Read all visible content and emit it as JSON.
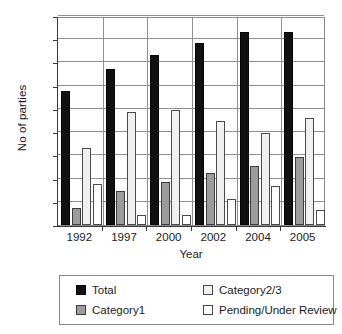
{
  "chart_data": {
    "type": "bar",
    "title": "",
    "xlabel": "Year",
    "ylabel": "No of parties",
    "categories": [
      "1992",
      "1997",
      "2000",
      "2002",
      "2004",
      "2005"
    ],
    "ylim": [
      0,
      180
    ],
    "yticks": [
      0,
      20,
      40,
      60,
      80,
      100,
      120,
      140,
      160,
      180
    ],
    "ytick_labels": [
      "0",
      "20",
      "40",
      "60",
      "80",
      "100",
      "120",
      "140",
      "160",
      "180"
    ],
    "grid": true,
    "legend_position": "bottom",
    "series": [
      {
        "name": "Total",
        "color": "#111111",
        "values": [
          115,
          134,
          146,
          157,
          166,
          166
        ]
      },
      {
        "name": "Category1",
        "color": "#9c9c9c",
        "values": [
          15,
          29,
          37,
          45,
          51,
          59
        ]
      },
      {
        "name": "Category2/3",
        "color": "#f0f0f0",
        "values": [
          66,
          97,
          99,
          90,
          79,
          92
        ]
      },
      {
        "name": "Pending/Under Review",
        "color": "#ffffff",
        "values": [
          35,
          9,
          9,
          22,
          34,
          13
        ]
      }
    ]
  },
  "legend": {
    "items": [
      {
        "label": "Total",
        "swatch": "sw-total"
      },
      {
        "label": "Category2/3",
        "swatch": "sw-cat23"
      },
      {
        "label": "Category1",
        "swatch": "sw-cat1"
      },
      {
        "label": "Pending/Under Review",
        "swatch": "sw-pending"
      }
    ]
  }
}
